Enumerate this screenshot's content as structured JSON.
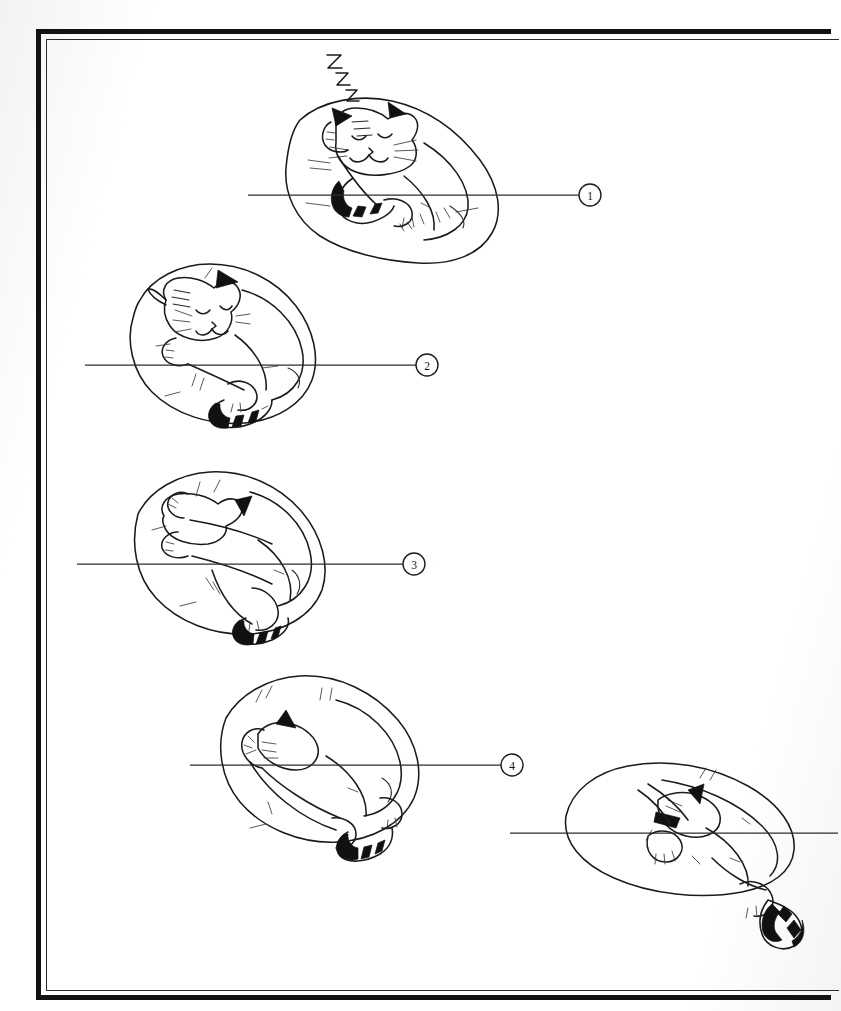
{
  "page": {
    "kind": "book-page-illustration",
    "background_color": "#ffffff",
    "ink_color": "#1b1b1b",
    "width": 841,
    "height": 1011
  },
  "frame": {
    "name": "page-border",
    "outer_stroke_color": "#121212",
    "inner_stroke_color": "#2a2a2a"
  },
  "callouts": [
    {
      "id": "callout-1",
      "label": "1",
      "cx": 590,
      "cy": 195,
      "r": 11,
      "line_x1": 248,
      "line_x2": 579,
      "line_y": 195
    },
    {
      "id": "callout-2",
      "label": "2",
      "cx": 427,
      "cy": 365,
      "r": 11,
      "line_x1": 85,
      "line_x2": 416,
      "line_y": 365
    },
    {
      "id": "callout-3",
      "label": "3",
      "cx": 414,
      "cy": 564,
      "r": 11,
      "line_x1": 77,
      "line_x2": 403,
      "line_y": 564
    },
    {
      "id": "callout-4",
      "label": "4",
      "cx": 512,
      "cy": 765,
      "r": 11,
      "line_x1": 190,
      "line_x2": 501,
      "line_y": 765
    },
    {
      "id": "callout-5",
      "label": "",
      "cx": 0,
      "cy": 0,
      "r": 0,
      "line_x1": 510,
      "line_x2": 838,
      "line_y": 833
    }
  ],
  "panels": [
    {
      "id": "panel-1",
      "name": "cat-stage-1",
      "caption": "Cat curled upright, head up, eyes closed, sleeping soundly",
      "marker": "1",
      "rotation_deg": 0,
      "has_zzz": true,
      "face_visible": true
    },
    {
      "id": "panel-2",
      "name": "cat-stage-2",
      "caption": "Cat rolled slightly, head tipped back over shoulder",
      "marker": "2",
      "rotation_deg": 35,
      "has_zzz": false,
      "face_visible": true
    },
    {
      "id": "panel-3",
      "name": "cat-stage-3",
      "caption": "Cat rolled further, head upside down, paws up",
      "marker": "3",
      "rotation_deg": 80,
      "has_zzz": false,
      "face_visible": false
    },
    {
      "id": "panel-4",
      "name": "cat-stage-4",
      "caption": "Cat almost fully inverted, head tucked under body",
      "marker": "4",
      "rotation_deg": 130,
      "has_zzz": false,
      "face_visible": false
    },
    {
      "id": "panel-5",
      "name": "cat-stage-5",
      "caption": "Cat fully unrolled and sprawled flat on its side",
      "marker": "",
      "rotation_deg": 180,
      "has_zzz": false,
      "face_visible": false
    }
  ],
  "sleep_marks": {
    "name": "zzz-sleep-marks",
    "letters": [
      "Z",
      "Z",
      "Z"
    ],
    "anchor_x": 330,
    "anchor_y": 100
  }
}
